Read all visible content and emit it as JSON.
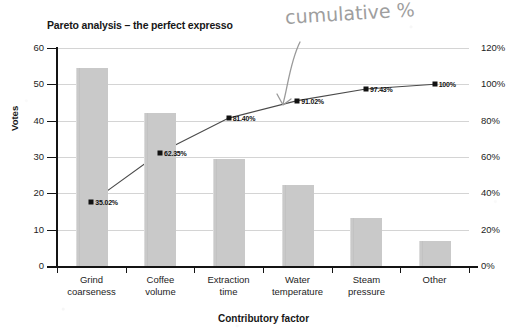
{
  "chart_data": {
    "type": "bar",
    "title": "Pareto analysis – the perfect expresso",
    "xlabel": "Contributory factor",
    "ylabel": "Votes",
    "y2label": "",
    "grid": true,
    "legend": "none",
    "categories": [
      "Grind coarseness",
      "Coffee volume",
      "Extraction time",
      "Water temperature",
      "Steam pressure",
      "Other"
    ],
    "category_lines": [
      [
        "Grind",
        "coarseness"
      ],
      [
        "Coffee",
        "volume"
      ],
      [
        "Extraction",
        "time"
      ],
      [
        "Water",
        "temperature"
      ],
      [
        "Steam",
        "pressure"
      ],
      [
        "Other",
        ""
      ]
    ],
    "series": [
      {
        "name": "Votes",
        "type": "bar",
        "axis": "left",
        "values": [
          54.5,
          42.0,
          29.5,
          22.2,
          13.3,
          6.8
        ]
      },
      {
        "name": "Cumulative %",
        "type": "line",
        "axis": "right",
        "values": [
          35.02,
          62.35,
          81.4,
          91.02,
          97.43,
          100.0
        ],
        "data_labels": [
          "35.02%",
          "62.35%",
          "81.40%",
          "91.02%",
          "97.43%",
          "100%"
        ]
      }
    ],
    "ylim": [
      0,
      60
    ],
    "yticks": [
      0,
      10,
      20,
      30,
      40,
      50,
      60
    ],
    "ytick_labels": [
      "0",
      "10",
      "20",
      "30",
      "40",
      "50",
      "60"
    ],
    "y2lim": [
      0,
      120
    ],
    "y2ticks": [
      0,
      20,
      40,
      60,
      80,
      100,
      120
    ],
    "y2tick_labels": [
      "0%",
      "20%",
      "40%",
      "60%",
      "80%",
      "100%",
      "120%"
    ]
  },
  "annotation": {
    "handwritten_note": "cumulative %",
    "arrow": "curved-arrow-down-left"
  },
  "colors": {
    "bar_fill": "#c9c9c9",
    "line": "#4a4a4a",
    "marker": "#111111",
    "axis": "#141414",
    "grid": "#d4d4d4",
    "pencil": "#8e8e8e"
  }
}
